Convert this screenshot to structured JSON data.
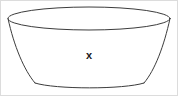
{
  "figure": {
    "name": "bowl-frustum-diagram",
    "label": "x",
    "label_position": {
      "x": 89,
      "y": 56
    },
    "colors": {
      "stroke": "#3c3c3c",
      "fill": "#ffffff",
      "background": "#ffffff",
      "frame": "#dcdcdc",
      "label": "#1a1a1a"
    },
    "geometry": {
      "rim_ellipse": {
        "center_x": 89,
        "center_y": 18.5,
        "radius_x": 81,
        "radius_y": 11.5,
        "top_y": 7,
        "front_y": 30,
        "left_x": 8,
        "right_x": 170
      },
      "base_arc": {
        "left_x": 35,
        "right_x": 144,
        "y": 85,
        "sag": 4
      },
      "left_wall": {
        "top_x": 8,
        "top_y": 18.5,
        "bottom_x": 35,
        "bottom_y": 83
      },
      "right_wall": {
        "top_x": 170,
        "top_y": 18.5,
        "bottom_x": 144,
        "bottom_y": 83
      }
    }
  }
}
